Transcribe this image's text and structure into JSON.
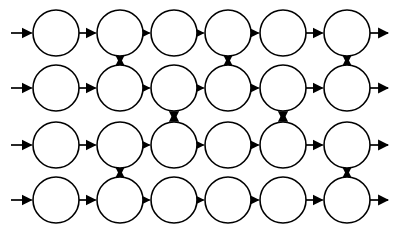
{
  "diagram": {
    "type": "node-graph",
    "background_color": "#ffffff",
    "stroke_color": "#000000",
    "node_fill_color": "#ffffff",
    "canvas": {
      "width": 397,
      "height": 237
    },
    "geometry": {
      "node_radius": 23,
      "column_centers": [
        56,
        120,
        174,
        228,
        283,
        347
      ],
      "row_centers": [
        33,
        88,
        145,
        200
      ],
      "rows": 4,
      "columns": 6,
      "total_nodes": 24
    },
    "nodes": [
      {
        "id": "n-r1-c1",
        "row": 1,
        "col": 1,
        "label": "",
        "cx": 56,
        "cy": 33
      },
      {
        "id": "n-r1-c2",
        "row": 1,
        "col": 2,
        "label": "",
        "cx": 120,
        "cy": 33
      },
      {
        "id": "n-r1-c3",
        "row": 1,
        "col": 3,
        "label": "",
        "cx": 174,
        "cy": 33
      },
      {
        "id": "n-r1-c4",
        "row": 1,
        "col": 4,
        "label": "",
        "cx": 228,
        "cy": 33
      },
      {
        "id": "n-r1-c5",
        "row": 1,
        "col": 5,
        "label": "",
        "cx": 283,
        "cy": 33
      },
      {
        "id": "n-r1-c6",
        "row": 1,
        "col": 6,
        "label": "",
        "cx": 347,
        "cy": 33
      },
      {
        "id": "n-r2-c1",
        "row": 2,
        "col": 1,
        "label": "",
        "cx": 56,
        "cy": 88
      },
      {
        "id": "n-r2-c2",
        "row": 2,
        "col": 2,
        "label": "",
        "cx": 120,
        "cy": 88
      },
      {
        "id": "n-r2-c3",
        "row": 2,
        "col": 3,
        "label": "",
        "cx": 174,
        "cy": 88
      },
      {
        "id": "n-r2-c4",
        "row": 2,
        "col": 4,
        "label": "",
        "cx": 228,
        "cy": 88
      },
      {
        "id": "n-r2-c5",
        "row": 2,
        "col": 5,
        "label": "",
        "cx": 283,
        "cy": 88
      },
      {
        "id": "n-r2-c6",
        "row": 2,
        "col": 6,
        "label": "",
        "cx": 347,
        "cy": 88
      },
      {
        "id": "n-r3-c1",
        "row": 3,
        "col": 1,
        "label": "",
        "cx": 56,
        "cy": 145
      },
      {
        "id": "n-r3-c2",
        "row": 3,
        "col": 2,
        "label": "",
        "cx": 120,
        "cy": 145
      },
      {
        "id": "n-r3-c3",
        "row": 3,
        "col": 3,
        "label": "",
        "cx": 174,
        "cy": 145
      },
      {
        "id": "n-r3-c4",
        "row": 3,
        "col": 4,
        "label": "",
        "cx": 228,
        "cy": 145
      },
      {
        "id": "n-r3-c5",
        "row": 3,
        "col": 5,
        "label": "",
        "cx": 283,
        "cy": 145
      },
      {
        "id": "n-r3-c6",
        "row": 3,
        "col": 6,
        "label": "",
        "cx": 347,
        "cy": 145
      },
      {
        "id": "n-r4-c1",
        "row": 4,
        "col": 1,
        "label": "",
        "cx": 56,
        "cy": 200
      },
      {
        "id": "n-r4-c2",
        "row": 4,
        "col": 2,
        "label": "",
        "cx": 120,
        "cy": 200
      },
      {
        "id": "n-r4-c3",
        "row": 4,
        "col": 3,
        "label": "",
        "cx": 174,
        "cy": 200
      },
      {
        "id": "n-r4-c4",
        "row": 4,
        "col": 4,
        "label": "",
        "cx": 228,
        "cy": 200
      },
      {
        "id": "n-r4-c5",
        "row": 4,
        "col": 5,
        "label": "",
        "cx": 283,
        "cy": 200
      },
      {
        "id": "n-r4-c6",
        "row": 4,
        "col": 6,
        "label": "",
        "cx": 347,
        "cy": 200
      }
    ],
    "horizontal_edges": [
      {
        "from": "n-r1-c1",
        "to": "n-r1-c2",
        "direction": "right",
        "arrowheads": 1
      },
      {
        "from": "n-r1-c2",
        "to": "n-r1-c3",
        "direction": "right",
        "arrowheads": 1
      },
      {
        "from": "n-r1-c3",
        "to": "n-r1-c4",
        "direction": "right",
        "arrowheads": 1
      },
      {
        "from": "n-r1-c4",
        "to": "n-r1-c5",
        "direction": "right",
        "arrowheads": 1
      },
      {
        "from": "n-r1-c5",
        "to": "n-r1-c6",
        "direction": "right",
        "arrowheads": 1
      },
      {
        "from": "n-r2-c1",
        "to": "n-r2-c2",
        "direction": "right",
        "arrowheads": 1
      },
      {
        "from": "n-r2-c2",
        "to": "n-r2-c3",
        "direction": "right",
        "arrowheads": 1
      },
      {
        "from": "n-r2-c3",
        "to": "n-r2-c4",
        "direction": "right",
        "arrowheads": 1
      },
      {
        "from": "n-r2-c4",
        "to": "n-r2-c5",
        "direction": "right",
        "arrowheads": 1
      },
      {
        "from": "n-r2-c5",
        "to": "n-r2-c6",
        "direction": "right",
        "arrowheads": 1
      },
      {
        "from": "n-r3-c1",
        "to": "n-r3-c2",
        "direction": "right",
        "arrowheads": 1
      },
      {
        "from": "n-r3-c2",
        "to": "n-r3-c3",
        "direction": "right",
        "arrowheads": 1
      },
      {
        "from": "n-r3-c3",
        "to": "n-r3-c4",
        "direction": "right",
        "arrowheads": 1
      },
      {
        "from": "n-r3-c4",
        "to": "n-r3-c5",
        "direction": "right",
        "arrowheads": 1
      },
      {
        "from": "n-r3-c5",
        "to": "n-r3-c6",
        "direction": "right",
        "arrowheads": 1
      },
      {
        "from": "n-r4-c1",
        "to": "n-r4-c2",
        "direction": "right",
        "arrowheads": 1
      },
      {
        "from": "n-r4-c2",
        "to": "n-r4-c3",
        "direction": "right",
        "arrowheads": 1
      },
      {
        "from": "n-r4-c3",
        "to": "n-r4-c4",
        "direction": "right",
        "arrowheads": 1
      },
      {
        "from": "n-r4-c4",
        "to": "n-r4-c5",
        "direction": "right",
        "arrowheads": 1
      },
      {
        "from": "n-r4-c5",
        "to": "n-r4-c6",
        "direction": "right",
        "arrowheads": 1
      }
    ],
    "vertical_edges": [
      {
        "from": "n-r1-c2",
        "to": "n-r2-c2",
        "direction": "bidirectional",
        "arrowheads": 2
      },
      {
        "from": "n-r1-c4",
        "to": "n-r2-c4",
        "direction": "bidirectional",
        "arrowheads": 2
      },
      {
        "from": "n-r1-c6",
        "to": "n-r2-c6",
        "direction": "bidirectional",
        "arrowheads": 2
      },
      {
        "from": "n-r2-c3",
        "to": "n-r3-c3",
        "direction": "bidirectional",
        "arrowheads": 2
      },
      {
        "from": "n-r2-c5",
        "to": "n-r3-c5",
        "direction": "bidirectional",
        "arrowheads": 2
      },
      {
        "from": "n-r3-c2",
        "to": "n-r4-c2",
        "direction": "bidirectional",
        "arrowheads": 2
      },
      {
        "from": "n-r3-c6",
        "to": "n-r4-c6",
        "direction": "bidirectional",
        "arrowheads": 2
      }
    ],
    "input_arrows": [
      {
        "id": "in-r1",
        "target": "n-r1-c1",
        "row": 1,
        "direction": "right"
      },
      {
        "id": "in-r2",
        "target": "n-r2-c1",
        "row": 2,
        "direction": "right"
      },
      {
        "id": "in-r3",
        "target": "n-r3-c1",
        "row": 3,
        "direction": "right"
      },
      {
        "id": "in-r4",
        "target": "n-r4-c1",
        "row": 4,
        "direction": "right"
      }
    ],
    "output_arrows": [
      {
        "id": "out-r1",
        "source": "n-r1-c6",
        "row": 1,
        "direction": "right"
      },
      {
        "id": "out-r2",
        "source": "n-r2-c6",
        "row": 2,
        "direction": "right"
      },
      {
        "id": "out-r3",
        "source": "n-r3-c6",
        "row": 3,
        "direction": "right"
      },
      {
        "id": "out-r4",
        "source": "n-r4-c6",
        "row": 4,
        "direction": "right"
      }
    ]
  }
}
